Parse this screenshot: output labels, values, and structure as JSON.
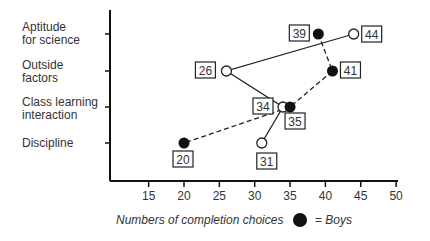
{
  "chart_data": {
    "type": "scatter",
    "title": "",
    "xlabel": "Numbers of completion choices",
    "ylabel": "",
    "xlim": [
      10,
      52
    ],
    "x_ticks": [
      15,
      20,
      25,
      30,
      35,
      40,
      45,
      50
    ],
    "categories": [
      "Aptitude for science",
      "Outside factors",
      "Class learning interaction",
      "Discipline"
    ],
    "series": [
      {
        "name": "Boys",
        "marker": "filled circle",
        "line": "dashed",
        "values": [
          39,
          41,
          35,
          20
        ]
      },
      {
        "name": "Girls",
        "marker": "open circle",
        "line": "solid",
        "values": [
          44,
          26,
          34,
          31
        ]
      }
    ],
    "grid": false,
    "legend": {
      "position": "bottom",
      "entries": [
        "= Boys"
      ]
    }
  },
  "labels": {
    "cat0a": "Aptitude",
    "cat0b": "for science",
    "cat1a": "Outside",
    "cat1b": "factors",
    "cat2a": "Class learning",
    "cat2b": "interaction",
    "cat3a": "Discipline",
    "xlabel": "Numbers of completion choices",
    "legend_eq": "= ",
    "legend_boys": "Boys"
  }
}
